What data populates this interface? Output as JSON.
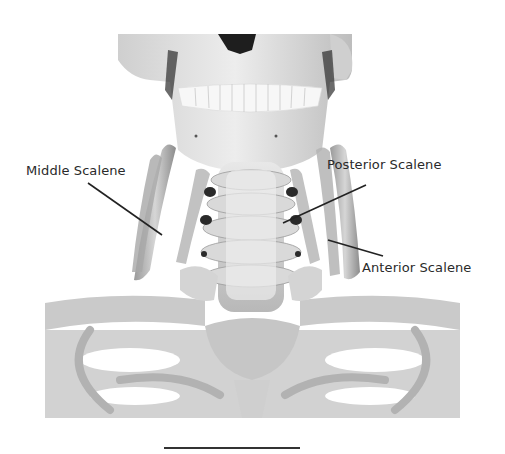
{
  "figure": {
    "labels": [
      {
        "id": "middle",
        "text": "Middle Scalene"
      },
      {
        "id": "posterior",
        "text": "Posterior Scalene"
      },
      {
        "id": "anterior",
        "text": "Anterior Scalene"
      }
    ]
  },
  "colors": {
    "background": "#ffffff",
    "bone_light": "#e6e6e6",
    "bone_mid": "#c4c4c4",
    "bone_dark": "#8a8a8a",
    "line": "#222222"
  }
}
